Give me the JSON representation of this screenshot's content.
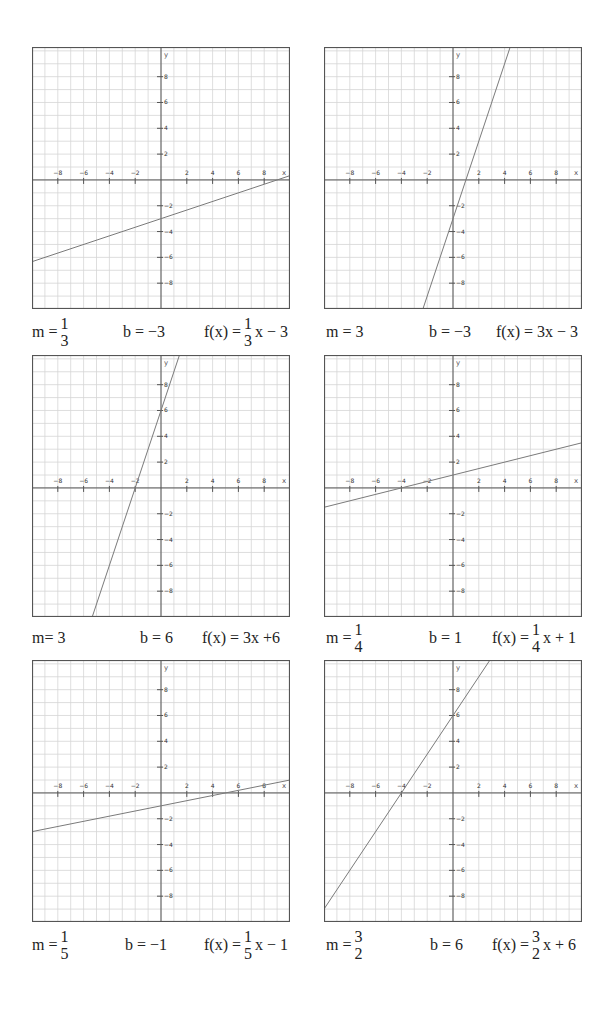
{
  "colors": {
    "grid": "#d6d6d6",
    "axis": "#555555",
    "border": "#555555",
    "line": "#7a7a7a",
    "text": "#222222"
  },
  "chart_data": [
    {
      "type": "line",
      "title": "",
      "xlabel": "x",
      "ylabel": "y",
      "xlim": [
        -10,
        10
      ],
      "ylim": [
        -10,
        10.3
      ],
      "grid": true,
      "x_ticks": [
        -8,
        -6,
        -4,
        -2,
        2,
        4,
        6,
        8
      ],
      "y_ticks": [
        8,
        6,
        4,
        2,
        -2,
        -4,
        -6,
        -8
      ],
      "series": [
        {
          "name": "f(x) = 1/3 x - 3",
          "slope": 0.3333,
          "intercept": -3
        }
      ],
      "caption": {
        "m": "1/3",
        "b": "−3",
        "f": "1/3 x − 3"
      }
    },
    {
      "type": "line",
      "title": "",
      "xlabel": "x",
      "ylabel": "y",
      "xlim": [
        -10,
        10
      ],
      "ylim": [
        -10,
        10.3
      ],
      "grid": true,
      "x_ticks": [
        -8,
        -6,
        -4,
        -2,
        2,
        4,
        6,
        8
      ],
      "y_ticks": [
        8,
        6,
        4,
        2,
        -2,
        -4,
        -6,
        -8
      ],
      "series": [
        {
          "name": "f(x) = 3x - 3",
          "slope": 3,
          "intercept": -3
        }
      ],
      "caption": {
        "m": "3",
        "b": "−3",
        "f": "3x − 3"
      }
    },
    {
      "type": "line",
      "title": "",
      "xlabel": "x",
      "ylabel": "y",
      "xlim": [
        -10,
        10
      ],
      "ylim": [
        -10,
        10.3
      ],
      "grid": true,
      "x_ticks": [
        -8,
        -6,
        -4,
        -2,
        2,
        4,
        6,
        8
      ],
      "y_ticks": [
        8,
        6,
        4,
        2,
        -2,
        -4,
        -6,
        -8
      ],
      "series": [
        {
          "name": "f(x) = 3x + 6",
          "slope": 3,
          "intercept": 6
        }
      ],
      "caption": {
        "m": "3",
        "b": "6",
        "f": "3x +6"
      }
    },
    {
      "type": "line",
      "title": "",
      "xlabel": "x",
      "ylabel": "y",
      "xlim": [
        -10,
        10
      ],
      "ylim": [
        -10,
        10.3
      ],
      "grid": true,
      "x_ticks": [
        -8,
        -6,
        -4,
        -2,
        2,
        4,
        6,
        8
      ],
      "y_ticks": [
        8,
        6,
        4,
        2,
        -2,
        -4,
        -6,
        -8
      ],
      "series": [
        {
          "name": "f(x) = 1/4 x + 1",
          "slope": 0.25,
          "intercept": 1
        }
      ],
      "caption": {
        "m": "1/4",
        "b": "1",
        "f": "1/4 x + 1"
      }
    },
    {
      "type": "line",
      "title": "",
      "xlabel": "x",
      "ylabel": "y",
      "xlim": [
        -10,
        10
      ],
      "ylim": [
        -10,
        10.3
      ],
      "grid": true,
      "x_ticks": [
        -8,
        -6,
        -4,
        -2,
        2,
        4,
        6,
        8
      ],
      "y_ticks": [
        8,
        6,
        4,
        2,
        -2,
        -4,
        -6,
        -8
      ],
      "series": [
        {
          "name": "f(x) = 1/5 x - 1",
          "slope": 0.2,
          "intercept": -1
        }
      ],
      "caption": {
        "m": "1/5",
        "b": "−1",
        "f": "1/5 x − 1"
      }
    },
    {
      "type": "line",
      "title": "",
      "xlabel": "x",
      "ylabel": "y",
      "xlim": [
        -10,
        10
      ],
      "ylim": [
        -10,
        10.3
      ],
      "grid": true,
      "x_ticks": [
        -8,
        -6,
        -4,
        -2,
        2,
        4,
        6,
        8
      ],
      "y_ticks": [
        8,
        6,
        4,
        2,
        -2,
        -4,
        -6,
        -8
      ],
      "series": [
        {
          "name": "f(x) = 3/2 x + 6",
          "slope": 1.5,
          "intercept": 6
        }
      ],
      "caption": {
        "m": "3/2",
        "b": "6",
        "f": "3/2 x + 6"
      }
    }
  ],
  "captions": [
    {
      "m_prefix": "m = ",
      "m_num": "1",
      "m_den": "3",
      "b": "b = −3",
      "f_prefix": "f(x) = ",
      "f_num": "1",
      "f_den": "3",
      "f_suffix": "x − 3"
    },
    {
      "m": "m = 3",
      "b": "b = −3",
      "f": "f(x) = 3x − 3"
    },
    {
      "m": "m= 3",
      "b": "b = 6",
      "f": "f(x) = 3x +6"
    },
    {
      "m_prefix": "m = ",
      "m_num": "1",
      "m_den": "4",
      "b": "b = 1",
      "f_prefix": "f(x) = ",
      "f_num": "1",
      "f_den": "4",
      "f_suffix": "x + 1"
    },
    {
      "m_prefix": "m = ",
      "m_num": "1",
      "m_den": "5",
      "b": "b = −1",
      "f_prefix": "f(x) =",
      "f_num": "1",
      "f_den": "5",
      "f_suffix": "x − 1"
    },
    {
      "m_prefix": "m = ",
      "m_num": "3",
      "m_den": "2",
      "b": "b = 6",
      "f_prefix": "f(x) = ",
      "f_num": "3",
      "f_den": "2",
      "f_suffix": "x + 6"
    }
  ]
}
